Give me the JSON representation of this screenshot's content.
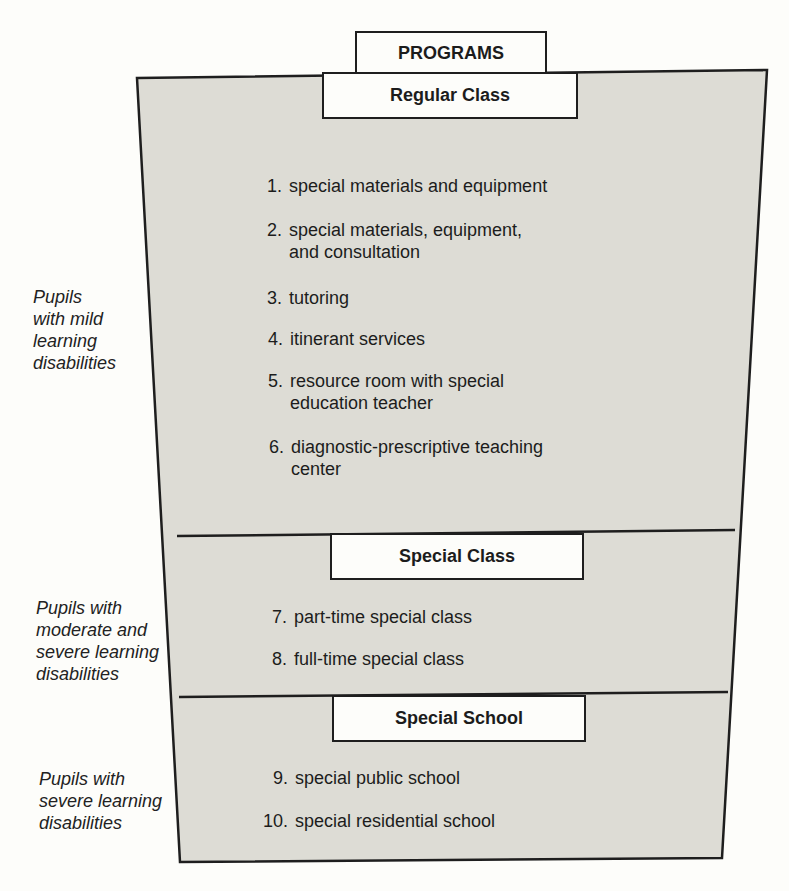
{
  "title": "PROGRAMS",
  "colors": {
    "band_fill": "#dddcd5",
    "outline": "#1e1e1e",
    "paper": "#fdfdfa"
  },
  "sections": [
    {
      "header": "Regular Class",
      "side_label": "Pupils\nwith mild\nlearning\ndisabilities",
      "items": [
        {
          "num": "1.",
          "text": "special materials and equipment"
        },
        {
          "num": "2.",
          "text": "special materials, equipment,\nand consultation"
        },
        {
          "num": "3.",
          "text": "tutoring"
        },
        {
          "num": "4.",
          "text": "itinerant services"
        },
        {
          "num": "5.",
          "text": "resource room with special\neducation teacher"
        },
        {
          "num": "6.",
          "text": "diagnostic-prescriptive teaching\ncenter"
        }
      ]
    },
    {
      "header": "Special Class",
      "side_label": "Pupils with\nmoderate and\nsevere learning\ndisabilities",
      "items": [
        {
          "num": "7.",
          "text": "part-time special class"
        },
        {
          "num": "8.",
          "text": "full-time special class"
        }
      ]
    },
    {
      "header": "Special School",
      "side_label": "Pupils with\nsevere learning\ndisabilities",
      "items": [
        {
          "num": "9.",
          "text": "special public school"
        },
        {
          "num": "10.",
          "text": "special residential school"
        }
      ]
    }
  ]
}
